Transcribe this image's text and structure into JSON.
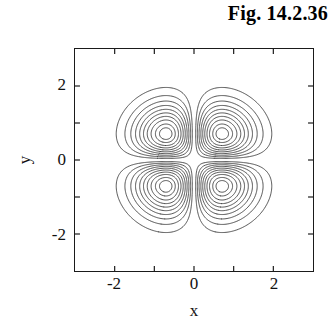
{
  "figure": {
    "title": "Fig. 14.2.36"
  },
  "axes": {
    "x_title": "x",
    "y_title": "y",
    "x_tick_labels": [
      "-2",
      "0",
      "2"
    ],
    "y_tick_labels": [
      "2",
      "0",
      "-2"
    ]
  },
  "style": {
    "contour_color": "#4a4a4a",
    "frame_color": "#1a1a1a",
    "background": "#ffffff",
    "text_color": "#111111"
  },
  "chart_data": {
    "type": "line",
    "subtype": "contour",
    "title": "Fig. 14.2.36",
    "xlabel": "x",
    "ylabel": "y",
    "xlim": [
      -3,
      3
    ],
    "ylim": [
      -3,
      3
    ],
    "grid": false,
    "legend": "none",
    "x_ticks": [
      -3,
      -2,
      -1,
      0,
      1,
      2,
      3
    ],
    "y_ticks": [
      -3,
      -2,
      -1,
      0,
      1,
      2,
      3
    ],
    "x_tick_labels": {
      "-2": "-2",
      "0": "0",
      "2": "2"
    },
    "y_tick_labels": {
      "2": "2",
      "0": "0",
      "-2": "-2"
    },
    "tick_direction": "in",
    "tick_sides": [
      "bottom",
      "left",
      "top",
      "right"
    ],
    "function": "z = x*y*exp(-(x^2 + y^2))",
    "lobe_centers": [
      {
        "x": -0.8,
        "y": 0.85,
        "sign": "negative"
      },
      {
        "x": 0.8,
        "y": 0.85,
        "sign": "positive"
      },
      {
        "x": -0.8,
        "y": -0.9,
        "sign": "positive"
      },
      {
        "x": 0.8,
        "y": -0.9,
        "sign": "negative"
      }
    ],
    "contour_levels_per_lobe": 10,
    "contour_level_magnitudes": [
      0.018,
      0.036,
      0.054,
      0.072,
      0.09,
      0.108,
      0.126,
      0.144,
      0.162,
      0.175
    ],
    "n_contours_total": 40,
    "line_color": "#4a4a4a",
    "line_width": 1
  }
}
